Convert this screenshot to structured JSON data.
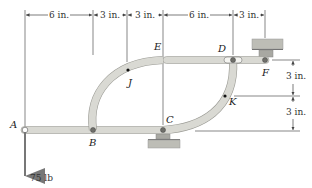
{
  "figure": {
    "type": "mechanism-linkage",
    "points": {
      "A": "A",
      "B": "B",
      "C": "C",
      "D": "D",
      "E": "E",
      "F": "F",
      "J": "J",
      "K": "K"
    },
    "horizontal_dimensions": [
      {
        "label": "6 in.",
        "from": "A",
        "to": "B"
      },
      {
        "label": "3 in.",
        "from": "B",
        "to": "J"
      },
      {
        "label": "3 in.",
        "from": "J",
        "to": "E"
      },
      {
        "label": "6 in.",
        "from": "E",
        "to": "D"
      },
      {
        "label": "3 in.",
        "from": "D",
        "to": "F"
      }
    ],
    "vertical_dimensions": [
      {
        "label": "3 in.",
        "from": "F",
        "to": "K"
      },
      {
        "label": "3 in.",
        "from": "K",
        "to": "C"
      }
    ],
    "load": {
      "label": "75 lb",
      "at": "A",
      "direction": "down"
    },
    "colors": {
      "member_fill": "#d9d9d3",
      "member_stroke": "#9a9a94",
      "support_fill": "#b9b9b2",
      "line": "#444444",
      "pin": "#6f6f6a"
    }
  }
}
